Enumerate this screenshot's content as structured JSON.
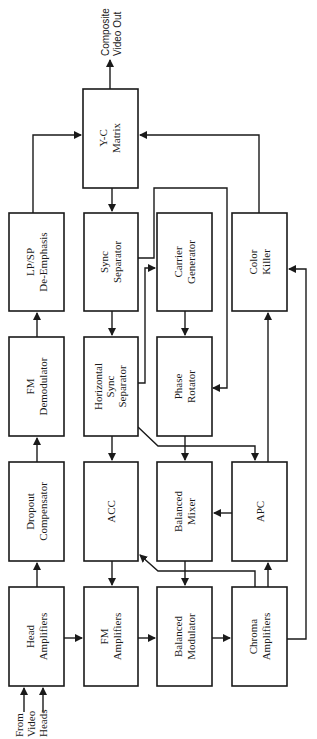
{
  "diagram": {
    "orientation": "rotated 90 degrees counter-clockwise",
    "colors": {
      "stroke": "#1a1a1a",
      "background": "#ffffff"
    },
    "blocks": {
      "yc_matrix": {
        "line1": "Y-C",
        "line2": "Matrix"
      },
      "lpsp_deemphasis": {
        "line1": "LP/SP",
        "line2": "De-Emphasis"
      },
      "sync_separator": {
        "line1": "Sync",
        "line2": "Separator"
      },
      "carrier_generator": {
        "line1": "Carrier",
        "line2": "Generator"
      },
      "color_killer": {
        "line1": "Color",
        "line2": "Killer"
      },
      "fm_demodulator": {
        "line1": "FM",
        "line2": "Demodulator"
      },
      "horizontal_sync_separator": {
        "line1": "Horizontal",
        "line2": "Sync",
        "line3": "Separator"
      },
      "phase_rotator": {
        "line1": "Phase",
        "line2": "Rotator"
      },
      "dropout_compensator": {
        "line1": "Dropout",
        "line2": "Compensator"
      },
      "acc": {
        "line1": "ACC"
      },
      "balanced_mixer": {
        "line1": "Balanced",
        "line2": "Mixer"
      },
      "apc": {
        "line1": "APC"
      },
      "head_amplifiers": {
        "line1": "Head",
        "line2": "Amplifiers"
      },
      "fm_amplifiers": {
        "line1": "FM",
        "line2": "Amplifiers"
      },
      "balanced_modulator": {
        "line1": "Balanced",
        "line2": "Modulator"
      },
      "chroma_amplifiers": {
        "line1": "Chroma",
        "line2": "Amplifiers"
      }
    },
    "input_label": {
      "line1": "From",
      "line2": "Video",
      "line3": "Heads"
    },
    "output_label": {
      "line1": "Composite",
      "line2": "Video Out"
    },
    "connections": [
      [
        "From Video Heads",
        "Head Amplifiers"
      ],
      [
        "Head Amplifiers",
        "Dropout Compensator"
      ],
      [
        "Dropout Compensator",
        "FM Demodulator"
      ],
      [
        "FM Demodulator",
        "LP/SP De-Emphasis"
      ],
      [
        "LP/SP De-Emphasis",
        "Y-C Matrix"
      ],
      [
        "Y-C Matrix",
        "Composite Video Out"
      ],
      [
        "Y-C Matrix",
        "Sync Separator"
      ],
      [
        "Sync Separator",
        "Horizontal Sync Separator"
      ],
      [
        "Sync Separator",
        "Phase Rotator"
      ],
      [
        "Horizontal Sync Separator",
        "Carrier Generator"
      ],
      [
        "Horizontal Sync Separator",
        "ACC"
      ],
      [
        "Horizontal Sync Separator",
        "APC"
      ],
      [
        "Carrier Generator",
        "Phase Rotator"
      ],
      [
        "Phase Rotator",
        "Balanced Mixer"
      ],
      [
        "APC",
        "Balanced Mixer"
      ],
      [
        "Head Amplifiers",
        "FM Amplifiers"
      ],
      [
        "ACC",
        "FM Amplifiers"
      ],
      [
        "FM Amplifiers",
        "Balanced Modulator"
      ],
      [
        "Balanced Mixer",
        "Balanced Modulator"
      ],
      [
        "Balanced Modulator",
        "Chroma Amplifiers"
      ],
      [
        "Chroma Amplifiers",
        "ACC"
      ],
      [
        "Chroma Amplifiers",
        "APC"
      ],
      [
        "Chroma Amplifiers",
        "Color Killer"
      ],
      [
        "APC",
        "Color Killer"
      ],
      [
        "Color Killer",
        "Y-C Matrix"
      ]
    ]
  }
}
